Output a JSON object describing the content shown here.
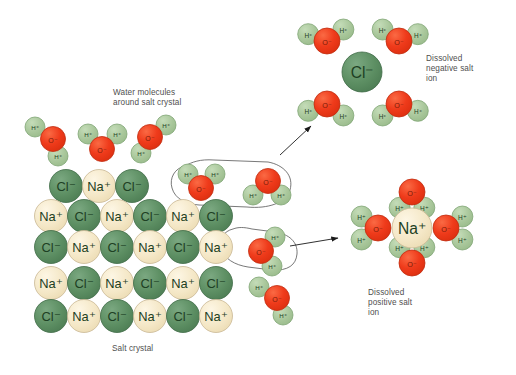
{
  "figure": {
    "title_visible": false,
    "background": "#ffffff",
    "type": "science-diagram"
  },
  "colors": {
    "chloride_fill": "#5d8f63",
    "chloride_stroke": "#3f6b46",
    "sodium_fill": "#f4e7c6",
    "sodium_stroke": "#c9b894",
    "oxygen_fill": "#ef3b1b",
    "oxygen_stroke": "#c02d10",
    "hydrogen_fill": "#a9c79b",
    "hydrogen_stroke": "#7fa473",
    "label_dark": "#1d4023",
    "label_oxygen": "#7a1a08",
    "caption_text": "#4f4f4f",
    "callout_stroke": "#555555",
    "arrow_stroke": "#1a1a1a"
  },
  "labels": {
    "chloride": "Cl⁻",
    "sodium": "Na⁺",
    "oxygen": "O⁻",
    "hydrogen": "H⁺"
  },
  "captions": {
    "water_molecules": "Water molecules\naround salt crystal",
    "salt_crystal": "Salt crystal",
    "dissolved_negative": "Dissolved\nnegative salt\nion",
    "dissolved_positive": "Dissolved\npositive salt\nion"
  },
  "chart_data": {
    "type": "diagram",
    "crystal_lattice": {
      "description": "Alternating checkerboard of Na+ and Cl- ions",
      "rows": [
        {
          "y": 186,
          "x_start": 66,
          "ions": [
            "Cl⁻",
            "Na⁺",
            "Cl⁻"
          ]
        },
        {
          "y": 216,
          "x_start": 51,
          "ions": [
            "Na⁺",
            "Cl⁻",
            "Na⁺",
            "Cl⁻",
            "Na⁺",
            "Cl⁻"
          ]
        },
        {
          "y": 247,
          "x_start": 51,
          "ions": [
            "Cl⁻",
            "Na⁺",
            "Cl⁻",
            "Na⁺",
            "Cl⁻",
            "Na⁺"
          ]
        },
        {
          "y": 283,
          "x_start": 51,
          "ions": [
            "Na⁺",
            "Cl⁻",
            "Na⁺",
            "Cl⁻",
            "Na⁺",
            "Cl⁻"
          ]
        },
        {
          "y": 316,
          "x_start": 51,
          "ions": [
            "Cl⁻",
            "Na⁺",
            "Cl⁻",
            "Na⁺",
            "Cl⁻",
            "Na⁺"
          ]
        }
      ],
      "ion_radius": 16.5,
      "spacing_x": 33
    },
    "free_water_molecules": [
      {
        "id": "w-top-1",
        "ox": 53,
        "oy": 139,
        "h1_angle": 150,
        "h2_angle": 250
      },
      {
        "id": "w-top-2",
        "ox": 102,
        "oy": 147,
        "h1_angle": 128,
        "h2_angle": 52
      },
      {
        "id": "w-top-3",
        "ox": 150,
        "oy": 137,
        "h1_angle": 38,
        "h2_angle": 248
      },
      {
        "id": "w-callout-upper",
        "ox": 201,
        "oy": 186,
        "h1_angle": 142,
        "h2_angle": 40
      },
      {
        "id": "w-right-1",
        "ox": 268,
        "oy": 180,
        "h1_angle": 214,
        "h2_angle": 326
      },
      {
        "id": "w-right-2",
        "ox": 262,
        "oy": 251,
        "h1_angle": 52,
        "h2_angle": 290
      },
      {
        "id": "w-right-3",
        "ox": 277,
        "oy": 297,
        "h1_angle": 150,
        "h2_angle": 290
      }
    ],
    "dissolved_negative_ion": {
      "center_label": "Cl⁻",
      "cx": 362,
      "cy": 72,
      "r": 20,
      "shell_count": 4,
      "shell_orientation": "hydrogen atoms point inward toward the negative ion",
      "waters": [
        {
          "ox": 327,
          "oy": 41,
          "h_inner_angle": 35,
          "h_outer_angle": 160
        },
        {
          "ox": 399,
          "oy": 41,
          "h_inner_angle": 145,
          "h_outer_angle": 20
        },
        {
          "ox": 327,
          "oy": 104,
          "h_inner_angle": 325,
          "h_outer_angle": 200
        },
        {
          "ox": 399,
          "oy": 104,
          "h_inner_angle": 215,
          "h_outer_angle": 340
        }
      ]
    },
    "dissolved_positive_ion": {
      "center_label": "Na⁺",
      "cx": 412,
      "cy": 228,
      "r": 20,
      "shell_count": 4,
      "shell_orientation": "oxygen atoms point inward toward the positive ion",
      "waters": [
        {
          "ox": 412,
          "oy": 192,
          "h1_angle": 232,
          "h2_angle": 308,
          "position": "top"
        },
        {
          "ox": 378,
          "oy": 228,
          "h1_angle": 145,
          "h2_angle": 215,
          "position": "left"
        },
        {
          "ox": 446,
          "oy": 228,
          "h1_angle": 35,
          "h2_angle": 325,
          "position": "right"
        },
        {
          "ox": 412,
          "oy": 263,
          "h1_angle": 128,
          "h2_angle": 52,
          "position": "bottom"
        }
      ]
    },
    "callouts": [
      {
        "id": "callout-upper",
        "targets": "Cl⁻ ion leaving crystal with water",
        "arrow_from": [
          282,
          152
        ],
        "arrow_to": [
          310,
          127
        ]
      },
      {
        "id": "callout-lower",
        "targets": "Na⁺ ion leaving crystal with water",
        "arrow_from": [
          289,
          245
        ],
        "arrow_to": [
          337,
          238
        ]
      }
    ]
  }
}
